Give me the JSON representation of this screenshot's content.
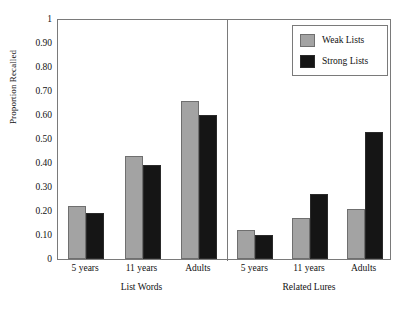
{
  "chart_data": {
    "type": "bar",
    "title": "",
    "xlabel": "",
    "ylabel": "Proportion Recalled",
    "ylim": [
      0,
      1
    ],
    "ytick_labels": [
      "1",
      "0.90",
      "0.80",
      "0.70",
      "0.60",
      "0.50",
      "0.40",
      "0.30",
      "0.20",
      "0.10",
      "0"
    ],
    "ytick_values": [
      1,
      0.9,
      0.8,
      0.7,
      0.6,
      0.5,
      0.4,
      0.3,
      0.2,
      0.1,
      0
    ],
    "grid": false,
    "legend_position": "top-right",
    "legend": [
      "Weak Lists",
      "Strong Lists"
    ],
    "panels": [
      {
        "label": "List Words",
        "categories": [
          "5 years",
          "11 years",
          "Adults"
        ],
        "series": [
          {
            "name": "Weak Lists",
            "values": [
              0.22,
              0.43,
              0.66
            ]
          },
          {
            "name": "Strong Lists",
            "values": [
              0.19,
              0.39,
              0.6
            ]
          }
        ]
      },
      {
        "label": "Related Lures",
        "categories": [
          "5 years",
          "11 years",
          "Adults"
        ],
        "series": [
          {
            "name": "Weak Lists",
            "values": [
              0.12,
              0.17,
              0.21
            ]
          },
          {
            "name": "Strong Lists",
            "values": [
              0.1,
              0.27,
              0.53
            ]
          }
        ]
      }
    ],
    "colors": {
      "weak_lists": "#a3a3a3",
      "strong_lists": "#151515",
      "axis": "#7a7a7a",
      "background": "#ffffff"
    }
  }
}
